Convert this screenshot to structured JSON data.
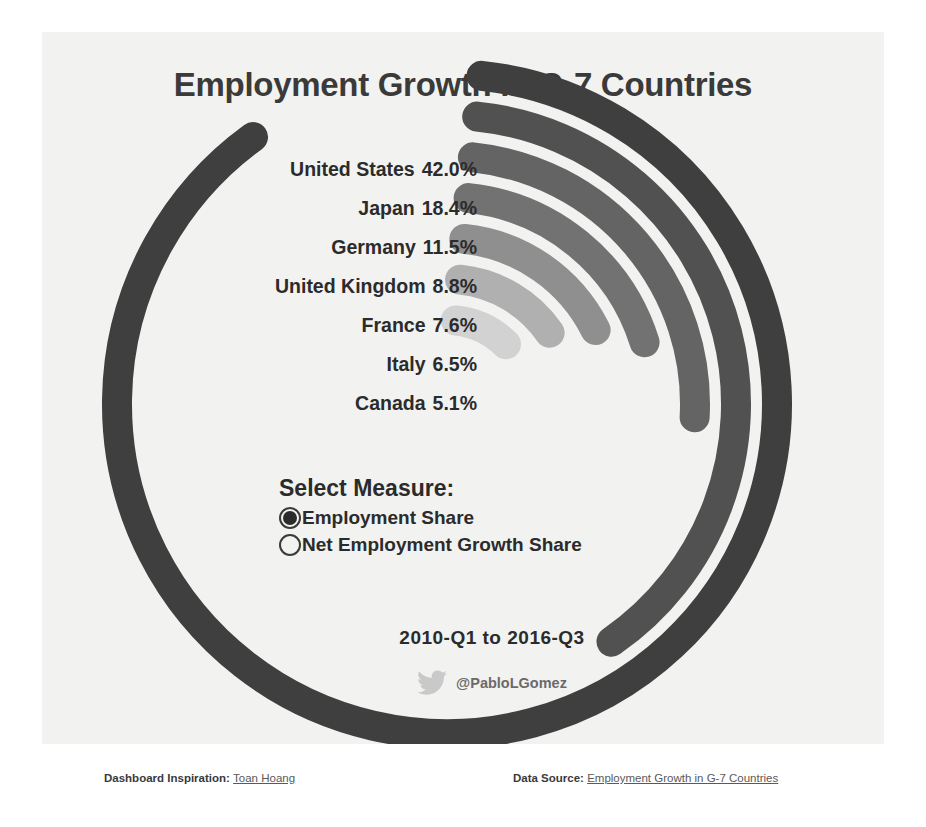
{
  "title": "Employment Growth in G-7 Countries",
  "chart_data": {
    "type": "bar",
    "title": "Employment Growth in G-7 Countries",
    "subtype": "radial-bar",
    "categories": [
      "United States",
      "Japan",
      "Germany",
      "United Kingdom",
      "France",
      "Italy",
      "Canada"
    ],
    "values": [
      42.0,
      18.4,
      11.5,
      8.8,
      7.6,
      6.5,
      5.1
    ],
    "value_labels": [
      "42.0%",
      "18.4%",
      "11.5%",
      "8.8%",
      "7.6%",
      "6.5%",
      "5.1%"
    ],
    "unit": "%",
    "xlabel": "",
    "ylabel": "Employment Share",
    "ylim": [
      0,
      42.0
    ],
    "grid": false,
    "legend": "none",
    "colors": [
      "#3f3f3f",
      "#515151",
      "#646464",
      "#727272",
      "#8f8f8f",
      "#b0b0b0",
      "#d2d2d2"
    ],
    "rows": [
      {
        "country": "United States",
        "value": 42.0,
        "display": "42.0%",
        "color": "#3f3f3f"
      },
      {
        "country": "Japan",
        "value": 18.4,
        "display": "18.4%",
        "color": "#515151"
      },
      {
        "country": "Germany",
        "value": 11.5,
        "display": "11.5%",
        "color": "#646464"
      },
      {
        "country": "United Kingdom",
        "value": 8.8,
        "display": "8.8%",
        "color": "#727272"
      },
      {
        "country": "France",
        "value": 7.6,
        "display": "7.6%",
        "color": "#8f8f8f"
      },
      {
        "country": "Italy",
        "value": 6.5,
        "display": "6.5%",
        "color": "#b0b0b0"
      },
      {
        "country": "Canada",
        "value": 5.1,
        "display": "5.1%",
        "color": "#d2d2d2"
      }
    ]
  },
  "controls": {
    "measure_title": "Select Measure:",
    "options": [
      {
        "label": "Employment Share",
        "selected": true
      },
      {
        "label": "Net Employment Growth Share",
        "selected": false
      }
    ]
  },
  "daterange": "2010-Q1 to 2016-Q3",
  "credit": {
    "icon": "twitter-bird-icon",
    "handle": "@PabloLGomez"
  },
  "footer": {
    "left_label": "Dashboard Inspiration:",
    "left_link": "Toan Hoang",
    "right_label": "Data Source:",
    "right_link": "Employment Growth in G-7 Countries"
  },
  "colors": {
    "canvas_bg": "#f2f2f0",
    "page_bg": "#ffffff",
    "title_color": "#3a3a3a",
    "text_color": "#2b2b2b"
  }
}
